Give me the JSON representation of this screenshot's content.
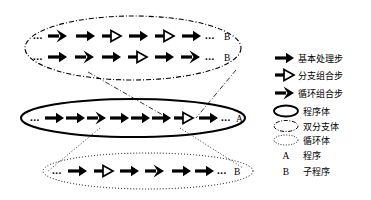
{
  "figure": {
    "background_color": "#ffffff",
    "ink_color": "#000000"
  },
  "symbols": {
    "basic_step": "solid-arrow",
    "branch_step": "hollow-triangle-arrow",
    "loop_step": "chevron-arrow",
    "ellipsis": "..."
  },
  "bodies": [
    {
      "id": "branch-body-top",
      "name": "branch-body",
      "border_style": "dash-dot",
      "label": "",
      "rows": [
        {
          "id": "top-row-1",
          "leading_dots": "...",
          "steps": [
            "loop",
            "basic",
            "branch",
            "basic",
            "branch",
            "basic"
          ],
          "trailing_dots": "...",
          "label": "B"
        },
        {
          "id": "top-row-2",
          "leading_dots": "...",
          "steps": [
            "basic",
            "loop",
            "basic",
            "branch",
            "basic",
            "loop"
          ],
          "trailing_dots": "...",
          "label": "B"
        }
      ]
    },
    {
      "id": "program-body-middle",
      "name": "program-body",
      "border_style": "solid",
      "label": "A",
      "rows": [
        {
          "id": "middle-row-1",
          "leading_dots": "...",
          "steps": [
            "basic",
            "basic",
            "loop",
            "basic",
            "basic",
            "basic",
            "branch",
            "basic"
          ],
          "trailing_dots": "...",
          "label": "A"
        }
      ]
    },
    {
      "id": "loop-body-bottom",
      "name": "loop-body",
      "border_style": "dotted",
      "label": "B",
      "rows": [
        {
          "id": "bottom-row-1",
          "leading_dots": "...",
          "steps": [
            "basic",
            "branch",
            "basic",
            "loop",
            "basic",
            "basic"
          ],
          "trailing_dots": "...",
          "label": "B"
        }
      ]
    }
  ],
  "connectors": [
    {
      "id": "connector-upper-left",
      "style": "dash-dot",
      "from": "branch-body-top",
      "to": "program-body-middle"
    },
    {
      "id": "connector-upper-right",
      "style": "dash-dot",
      "from": "branch-body-top",
      "to": "program-body-middle"
    },
    {
      "id": "connector-lower-left",
      "style": "dotted",
      "from": "program-body-middle",
      "to": "loop-body-bottom"
    },
    {
      "id": "connector-lower-right",
      "style": "dotted",
      "from": "program-body-middle",
      "to": "loop-body-bottom"
    }
  ],
  "legend": {
    "items": [
      {
        "id": "legend-basic-step",
        "icon": "solid-arrow",
        "label": "基本处理步"
      },
      {
        "id": "legend-branch-step",
        "icon": "hollow-triangle-arrow",
        "label": "分支组合步"
      },
      {
        "id": "legend-loop-step",
        "icon": "chevron-arrow",
        "label": "循环组合步"
      },
      {
        "id": "legend-program-body",
        "icon": "solid-ellipse",
        "label": "程序体"
      },
      {
        "id": "legend-branch-body",
        "icon": "dash-dot-ellipse",
        "label": "双分支体"
      },
      {
        "id": "legend-loop-body",
        "icon": "dotted-ellipse",
        "label": "循环体"
      },
      {
        "id": "legend-program",
        "icon": "letter-A",
        "label": "程序",
        "marker": "A"
      },
      {
        "id": "legend-subprogram",
        "icon": "letter-B",
        "label": "子程序",
        "marker": "B"
      }
    ]
  }
}
